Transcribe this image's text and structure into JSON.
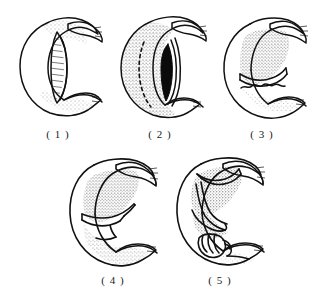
{
  "plate": {
    "background_color": "#ffffff",
    "ink_color": "#111111",
    "layout": "2-row grid: 3 figures on top row, 2 figures on bottom row",
    "style": "black-and-white stippled pen-and-ink anatomical line drawing"
  },
  "figures": [
    {
      "id": "figure-1",
      "caption": "( 1 )",
      "number": "1",
      "description": "C-shaped curved organ shown in outline with a long narrow slit opening down the inner concave face; stippled shading along the right inner margin and at the lower tail.",
      "shading": "light stipple on inner right margin and lower lobe",
      "slit": "long narrow lens-shaped opening, unfilled"
    },
    {
      "id": "figure-2",
      "caption": "( 2 )",
      "number": "2",
      "description": "Same C-shaped organ with heavy stipple over the whole outer body and a dashed guide line; a narrow solid-black wedge opening appears along the inner curve.",
      "shading": "dense stipple across body with dashed inner guide line",
      "slit": "narrow solid black wedge"
    },
    {
      "id": "figure-3",
      "caption": "( 3 )",
      "number": "3",
      "description": "Upper lobe densely stippled and separated by a transverse incision line; the lower lobe is lightly stippled with a ragged cut edge facing the gap.",
      "shading": "dense stipple upper lobe, light stipple lower lobe",
      "slit": "transverse cut separating upper and lower lobes"
    },
    {
      "id": "figure-4",
      "caption": "( 4 )",
      "number": "4",
      "description": "The two lobes brought together: a broad stippled upper lobe and a long stippled lower limb meeting at a stepped transverse suture line near the mid inner curve.",
      "shading": "graded stipple, heavier toward the inner concave edge",
      "slit": "stepped transverse suture line at mid inner curve"
    },
    {
      "id": "figure-5",
      "caption": "( 5 )",
      "number": "5",
      "description": "Final stage: the stippled upper lobe is folded over with overlapping flap outlines, and a banded cylindrical segment with cross-hatched ties sits at the lower inner curve.",
      "shading": "dense stipple on folded upper lobe, light stipple on lower tail",
      "slit": "overlapping folded flap plus banded cylindrical segment with tie lines"
    }
  ]
}
